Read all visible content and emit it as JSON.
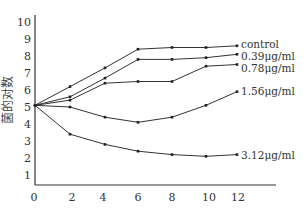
{
  "chart_data": {
    "type": "line",
    "title": "",
    "xlabel": "",
    "ylabel": "菌的对数",
    "x": [
      0,
      2,
      4,
      6,
      8,
      10,
      12
    ],
    "x_ticks": [
      "0",
      "2",
      "4",
      "6",
      "8",
      "10",
      "12"
    ],
    "y_ticks": [
      "1",
      "2",
      "3",
      "4",
      "5",
      "6",
      "7",
      "8",
      "9",
      "10"
    ],
    "ylim": [
      0,
      10
    ],
    "grid": false,
    "legend_position": "inline-right",
    "series": [
      {
        "name": "control",
        "values": [
          5.1,
          6.2,
          7.3,
          8.4,
          8.5,
          8.5,
          8.6
        ]
      },
      {
        "name": "0.39μg/ml",
        "values": [
          5.1,
          5.6,
          6.7,
          7.8,
          7.8,
          7.9,
          8.1
        ]
      },
      {
        "name": "0.78μg/ml",
        "values": [
          5.1,
          5.4,
          6.4,
          6.5,
          6.5,
          7.4,
          7.5
        ]
      },
      {
        "name": "1.56μg/ml",
        "values": [
          5.1,
          5.0,
          4.4,
          4.1,
          4.4,
          5.1,
          5.9
        ]
      },
      {
        "name": "3.12μg/ml",
        "values": [
          5.1,
          3.4,
          2.8,
          2.4,
          2.2,
          2.1,
          2.2
        ]
      }
    ]
  }
}
